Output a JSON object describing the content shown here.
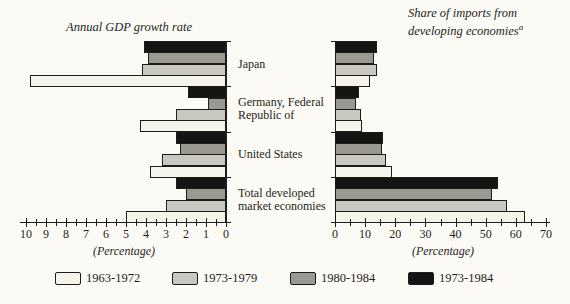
{
  "figure": {
    "left_title": "Annual GDP growth rate",
    "right_title_line1": "Share of imports from",
    "right_title_line2": "developing economies",
    "right_title_superscript": "a",
    "background": "#fbfaf4",
    "ink_color": "#1c1c1a"
  },
  "legend": {
    "items": [
      {
        "label": "1963-1972",
        "color": "#f6f4ea"
      },
      {
        "label": "1973-1979",
        "color": "#c9c8c0"
      },
      {
        "label": "1980-1984",
        "color": "#9a9890"
      },
      {
        "label": "1973-1984",
        "color": "#141412"
      }
    ]
  },
  "chart_data": [
    {
      "type": "bar",
      "orientation": "horizontal-right-anchored",
      "title": "Annual GDP growth rate",
      "xlabel": "(Percentage)",
      "xlim": [
        10,
        0
      ],
      "axis_ticks": [
        10,
        9,
        8,
        7,
        6,
        5,
        4,
        3,
        2,
        1,
        0
      ],
      "minor_tick_step": 0.5,
      "grid": false,
      "categories": [
        "Japan",
        "Germany, Federal Republic of",
        "United States",
        "Total developed market economies"
      ],
      "category_label_lines": [
        [
          "Japan"
        ],
        [
          "Germany, Federal",
          "Republic of"
        ],
        [
          "United States"
        ],
        [
          "Total developed",
          "market economies"
        ]
      ],
      "series": [
        {
          "name": "1973-1984",
          "color": "#141412",
          "values": [
            4.1,
            1.9,
            2.5,
            2.5
          ]
        },
        {
          "name": "1980-1984",
          "color": "#9a9890",
          "values": [
            3.9,
            0.9,
            2.3,
            2.0
          ]
        },
        {
          "name": "1973-1979",
          "color": "#c9c8c0",
          "values": [
            4.2,
            2.5,
            3.2,
            3.0
          ]
        },
        {
          "name": "1963-1972",
          "color": "#f6f4ea",
          "values": [
            9.8,
            4.3,
            3.8,
            5.0
          ]
        }
      ]
    },
    {
      "type": "bar",
      "orientation": "horizontal-left-anchored",
      "title": "Share of imports from developing economies",
      "footnote_marker": "a",
      "xlabel": "(Percentage)",
      "xlim": [
        0,
        70
      ],
      "axis_ticks": [
        0,
        10,
        20,
        30,
        40,
        50,
        60,
        70
      ],
      "minor_tick_step": 5,
      "grid": false,
      "categories": [
        "Japan",
        "Germany, Federal Republic of",
        "United States",
        "Total developed market economies"
      ],
      "category_label_lines": [
        [
          "Japan"
        ],
        [
          "Germany, Federal",
          "Republic of"
        ],
        [
          "United States"
        ],
        [
          "Total developed",
          "market economies"
        ]
      ],
      "series": [
        {
          "name": "1973-1984",
          "color": "#141412",
          "values": [
            14,
            8,
            16,
            54
          ]
        },
        {
          "name": "1980-1984",
          "color": "#9a9890",
          "values": [
            13,
            7,
            15.5,
            52
          ]
        },
        {
          "name": "1973-1979",
          "color": "#c9c8c0",
          "values": [
            14,
            8.5,
            17,
            57
          ]
        },
        {
          "name": "1963-1972",
          "color": "#f6f4ea",
          "values": [
            11.5,
            9,
            19,
            63
          ]
        }
      ]
    }
  ]
}
